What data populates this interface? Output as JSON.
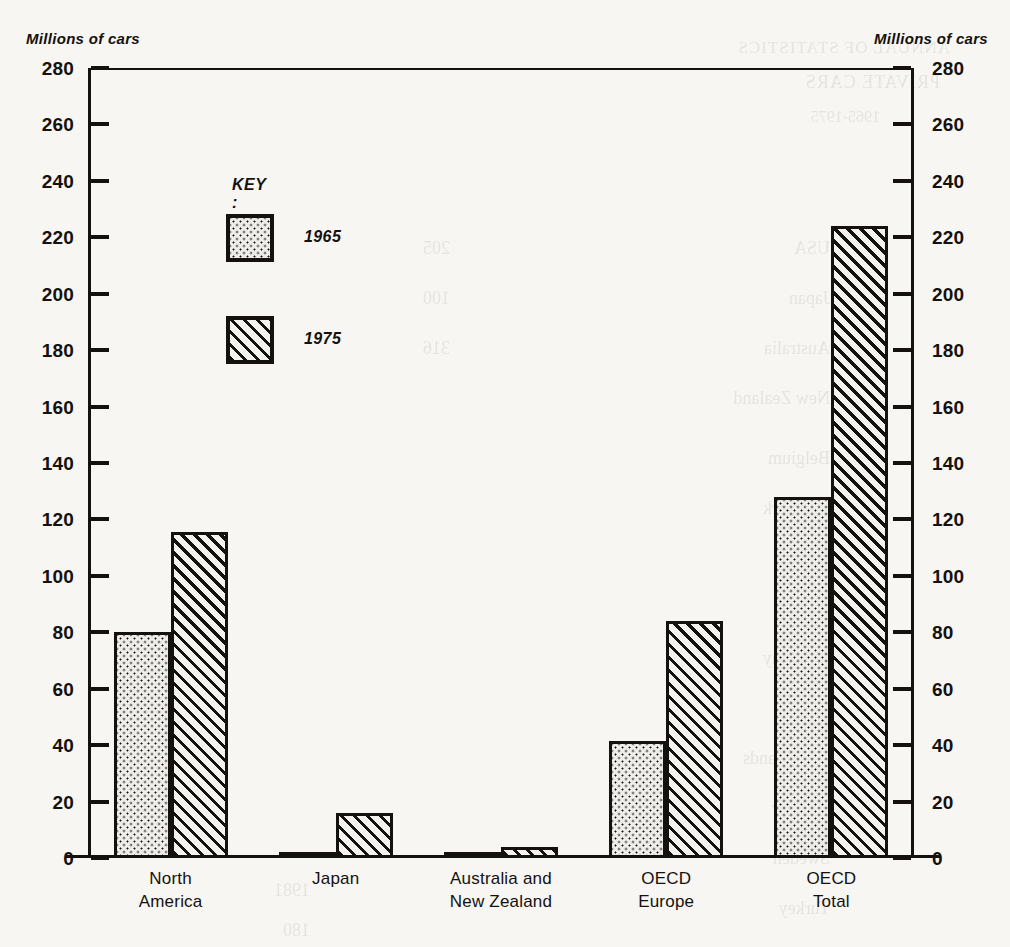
{
  "axis_titles": {
    "left": "Millions of cars",
    "right": "Millions of cars"
  },
  "key": {
    "title": "KEY :",
    "entries": [
      {
        "label": "1965",
        "pattern": "dotted"
      },
      {
        "label": "1975",
        "pattern": "diagonal-hatch"
      }
    ]
  },
  "chart_data": {
    "type": "bar",
    "title": "",
    "xlabel": "",
    "ylabel": "Millions of cars",
    "ylim": [
      0,
      280
    ],
    "ytick_step": 20,
    "yticks": [
      0,
      20,
      40,
      60,
      80,
      100,
      120,
      140,
      160,
      180,
      200,
      220,
      240,
      260,
      280
    ],
    "grid": false,
    "legend_position": "inside-top-left",
    "categories": [
      "North America",
      "Japan",
      "Australia and New Zealand",
      "OECD Europe",
      "OECD Total"
    ],
    "category_lines": [
      [
        "North",
        "America"
      ],
      [
        "Japan",
        ""
      ],
      [
        "Australia and",
        "New Zealand"
      ],
      [
        "OECD",
        "Europe"
      ],
      [
        "OECD",
        "Total"
      ]
    ],
    "series": [
      {
        "name": "1965",
        "values": [
          80,
          1.5,
          1.8,
          41.5,
          128
        ]
      },
      {
        "name": "1975",
        "values": [
          115.5,
          16,
          4,
          84,
          224
        ]
      }
    ]
  },
  "colors": {
    "ink": "#14110f",
    "paper": "#f7f6f3"
  },
  "bleed_through": [
    "ANNUAL OF STATISTICS",
    "PRIVATE CARS",
    "1965-1975",
    "USA",
    "Japan",
    "Australia",
    "New Zealand",
    "Belgium",
    "Denmark",
    "Finland",
    "France",
    "Germany",
    "Italy",
    "Netherlands",
    "Norway",
    "Sweden",
    "Turkey",
    "1981",
    "180",
    "205",
    "100",
    "316",
    "918"
  ]
}
